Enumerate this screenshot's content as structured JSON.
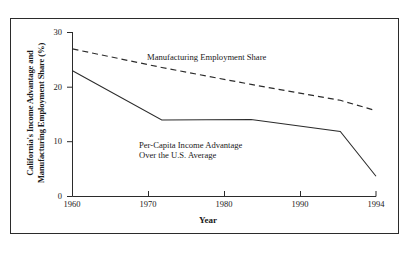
{
  "figure": {
    "background_color": "#ffffff",
    "frame_color": "#2b2b2b",
    "line_color": "#2b2b2b"
  },
  "axis": {
    "y_label_line1": "California's Income Advantage and",
    "y_label_line2": "Manufacturing Employment Share (%)",
    "x_label": "Year",
    "y_ticks": [
      "0",
      "10",
      "20",
      "30"
    ],
    "x_ticks": [
      "1960",
      "1970",
      "1980",
      "1990",
      "1994"
    ]
  },
  "annotations": {
    "manufacturing": "Manufacturing Employment Share",
    "percapita_line1": "Per-Capita Income Advantage",
    "percapita_line2": "Over the U.S. Average"
  },
  "chart_data": {
    "type": "line",
    "title": "",
    "xlabel": "Year",
    "ylabel": "California's Income Advantage and Manufacturing Employment Share (%)",
    "x": [
      1960,
      1970,
      1980,
      1990,
      1994
    ],
    "xlim": [
      1960,
      1994
    ],
    "ylim": [
      0,
      30
    ],
    "y_ticks": [
      0,
      10,
      20,
      30
    ],
    "x_ticks": [
      1960,
      1970,
      1980,
      1990,
      1994
    ],
    "grid": false,
    "legend": "inline-annotations",
    "series": [
      {
        "name": "Manufacturing Employment Share",
        "style": "dashed",
        "color": "#2b2b2b",
        "values": [
          27.0,
          23.6,
          20.5,
          17.6,
          15.7
        ]
      },
      {
        "name": "Per-Capita Income Advantage Over the U.S. Average",
        "style": "solid",
        "color": "#2b2b2b",
        "values": [
          23.0,
          14.0,
          14.1,
          11.9,
          3.7
        ]
      }
    ]
  }
}
